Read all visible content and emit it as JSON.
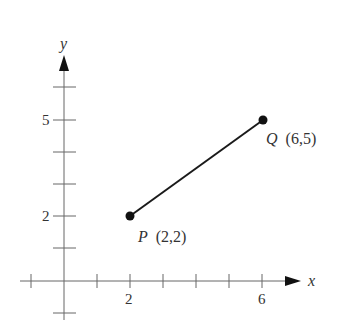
{
  "axes": {
    "x_label": "x",
    "y_label": "y",
    "x_tick_labels": [
      {
        "value": 2,
        "text": "2"
      },
      {
        "value": 6,
        "text": "6"
      }
    ],
    "y_tick_labels": [
      {
        "value": 2,
        "text": "2"
      },
      {
        "value": 5,
        "text": "5"
      }
    ],
    "x_ticks": [
      -1,
      1,
      2,
      3,
      4,
      5,
      6
    ],
    "y_ticks": [
      -1,
      1,
      2,
      3,
      4,
      5,
      6
    ]
  },
  "points": {
    "P": {
      "name": "P",
      "coords": "(2,2)",
      "x": 2,
      "y": 2
    },
    "Q": {
      "name": "Q",
      "coords": "(6,5)",
      "x": 6,
      "y": 5
    }
  },
  "segment": {
    "from": "P",
    "to": "Q"
  },
  "colors": {
    "axis": "#555555",
    "segment": "#1a1a1a",
    "text": "#333333"
  }
}
